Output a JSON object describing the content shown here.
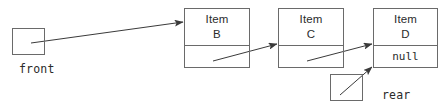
{
  "diagram": {
    "type": "linked-list-queue",
    "colors": {
      "stroke": "#6a6a6a",
      "arrow": "#3a3a3a",
      "text": "#2b2b2b",
      "background": "#ffffff"
    },
    "pointers": [
      {
        "id": "front",
        "label": "front",
        "box": {
          "x": 12,
          "y": 28,
          "width": 33,
          "height": 27
        },
        "label_pos": {
          "x": 19,
          "y": 62
        },
        "target": "node-b"
      },
      {
        "id": "rear",
        "label": "rear",
        "box": {
          "x": 330,
          "y": 74,
          "width": 33,
          "height": 27
        },
        "label_pos": {
          "x": 382,
          "y": 88
        },
        "target": "node-d"
      }
    ],
    "nodes": [
      {
        "id": "node-b",
        "data_line1": "Item",
        "data_line2": "B",
        "next_text": "",
        "box": {
          "x": 184,
          "y": 8,
          "width": 66,
          "height": 60
        },
        "next_target": "node-c"
      },
      {
        "id": "node-c",
        "data_line1": "Item",
        "data_line2": "C",
        "next_text": "",
        "box": {
          "x": 278,
          "y": 8,
          "width": 66,
          "height": 60
        },
        "next_target": "node-d"
      },
      {
        "id": "node-d",
        "data_line1": "Item",
        "data_line2": "D",
        "next_text": "null",
        "box": {
          "x": 373,
          "y": 8,
          "width": 65,
          "height": 60
        },
        "next_target": null
      }
    ],
    "arrows": [
      {
        "id": "front-to-b",
        "from": {
          "x": 31,
          "y": 43
        },
        "to": {
          "x": 183,
          "y": 22
        },
        "source": "front",
        "target": "node-b"
      },
      {
        "id": "b-to-c",
        "from": {
          "x": 213,
          "y": 61
        },
        "to": {
          "x": 277,
          "y": 44
        },
        "source": "node-b",
        "target": "node-c"
      },
      {
        "id": "c-to-d",
        "from": {
          "x": 307,
          "y": 61
        },
        "to": {
          "x": 372,
          "y": 44
        },
        "source": "node-c",
        "target": "node-d"
      },
      {
        "id": "rear-to-d",
        "from": {
          "x": 340,
          "y": 95
        },
        "to": {
          "x": 372,
          "y": 67
        },
        "source": "rear",
        "target": "node-d"
      }
    ]
  }
}
